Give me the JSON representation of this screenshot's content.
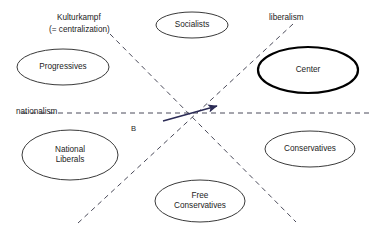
{
  "diagram": {
    "type": "political-spectrum-scatter",
    "background_color": "#ffffff",
    "axes": [
      {
        "id": "nationalism",
        "label": "nationalism",
        "orientation": "horizontal",
        "style": "dashed",
        "color": "#4b4b5a",
        "x1": 22,
        "y1": 113,
        "x2": 371,
        "y2": 113,
        "label_x": 16,
        "label_y": 108
      },
      {
        "id": "kulturkampf",
        "label": "Kulturkampf",
        "sublabel": "(= centralization)",
        "orientation": "diagonal-down-right",
        "style": "dashed",
        "color": "#4b4b5a",
        "x1": 110,
        "y1": 34,
        "x2": 296,
        "y2": 222,
        "label_x": 57,
        "label_y": 14,
        "sublabel_x": 49,
        "sublabel_y": 26
      },
      {
        "id": "liberalism",
        "label": "liberalism",
        "orientation": "diagonal-down-left",
        "style": "dashed",
        "color": "#4b4b5a",
        "x1": 293,
        "y1": 24,
        "x2": 78,
        "y2": 223,
        "label_x": 269,
        "label_y": 14
      }
    ],
    "arrow": {
      "id": "movement-arrow",
      "color": "#2b2b55",
      "x1": 163,
      "y1": 121,
      "x2": 217,
      "y2": 106,
      "head": "end"
    },
    "markers": [
      {
        "id": "point-b",
        "label": "B",
        "x": 131,
        "y": 131
      }
    ],
    "nodes": [
      {
        "id": "progressives",
        "label": "Progressives",
        "lines": [
          "Progressives"
        ],
        "cx": 63,
        "cy": 67,
        "rx": 46,
        "ry": 18,
        "emphasis": "normal"
      },
      {
        "id": "socialists",
        "label": "Socialists",
        "lines": [
          "Socialists"
        ],
        "cx": 192,
        "cy": 25,
        "rx": 36,
        "ry": 13,
        "emphasis": "normal"
      },
      {
        "id": "center",
        "label": "Center",
        "lines": [
          "Center"
        ],
        "cx": 308,
        "cy": 70,
        "rx": 50,
        "ry": 23,
        "emphasis": "bold"
      },
      {
        "id": "national-liberals",
        "label": "National Liberals",
        "lines": [
          "National",
          "Liberals"
        ],
        "cx": 70,
        "cy": 155,
        "rx": 48,
        "ry": 25,
        "emphasis": "normal"
      },
      {
        "id": "conservatives",
        "label": "Conservatives",
        "cx": 310,
        "cy": 149,
        "rx": 45,
        "ry": 18,
        "lines": [
          "Conservatives"
        ],
        "emphasis": "normal"
      },
      {
        "id": "free-conservatives",
        "label": "Free Conservatives",
        "lines": [
          "Free",
          "Conservatives"
        ],
        "cx": 200,
        "cy": 201,
        "rx": 45,
        "ry": 21,
        "emphasis": "normal"
      }
    ]
  }
}
